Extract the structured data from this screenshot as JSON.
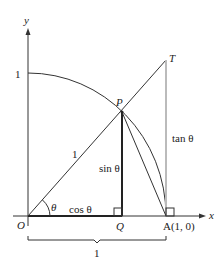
{
  "diagram": {
    "axes": {
      "x_label": "x",
      "y_label": "y",
      "y_tick_label": "1"
    },
    "points": {
      "O": "O",
      "P": "P",
      "Q": "Q",
      "A": "A(1, 0)",
      "T": "T"
    },
    "labels": {
      "radius": "1",
      "angle": "θ",
      "cos": "cos θ",
      "sin": "sin θ",
      "tan": "tan θ",
      "brace": "1"
    },
    "colors": {
      "line": "#333333",
      "tan_segment": "#bbbbbb",
      "background": "#ffffff"
    }
  }
}
